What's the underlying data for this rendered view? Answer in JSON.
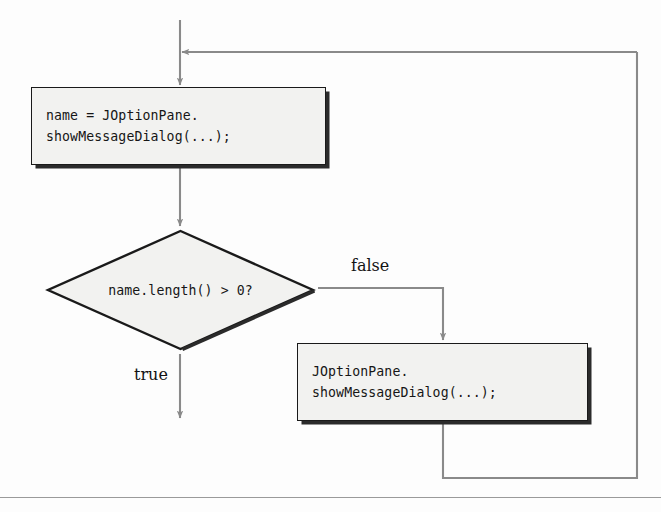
{
  "diagram": {
    "type": "flowchart",
    "nodes": [
      {
        "id": "input-statement",
        "shape": "process",
        "lines": [
          "name = JOptionPane.",
          "showMessageDialog(...);"
        ]
      },
      {
        "id": "length-check",
        "shape": "decision",
        "text": "name.length() > 0?"
      },
      {
        "id": "reprompt-statement",
        "shape": "process",
        "lines": [
          "JOptionPane.",
          "showMessageDialog(...);"
        ]
      }
    ],
    "edge_labels": {
      "false": "false",
      "true": "true"
    },
    "colors": {
      "node_fill": "#f2f2f0",
      "node_stroke": "#1a1a1a",
      "node_shadow": "#2b2b2b",
      "connector": "#8a8a8a",
      "rule": "#9a9a9a",
      "text": "#161616"
    }
  }
}
